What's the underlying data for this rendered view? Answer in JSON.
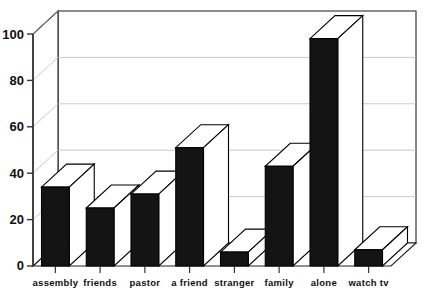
{
  "chart_data": {
    "type": "bar",
    "title": "",
    "subtitle": "",
    "xlabel": "",
    "ylabel": "",
    "categories": [
      "assembly",
      "friends",
      "pastor",
      "a friend",
      "stranger",
      "family",
      "alone",
      "watch tv"
    ],
    "values": [
      34,
      25,
      31,
      51,
      6,
      43,
      98,
      7
    ],
    "series": [
      {
        "name": "",
        "values": [
          34,
          25,
          31,
          51,
          6,
          43,
          98,
          7
        ]
      }
    ],
    "ylim": [
      0,
      100
    ],
    "yticks": [
      0,
      20,
      40,
      60,
      80,
      100
    ],
    "ytick_labels": [
      "0",
      "20",
      "40",
      "60",
      "80",
      "100"
    ],
    "grid": true,
    "grid_axis": "y",
    "legend": false,
    "legend_position": "none",
    "style": "3d-bar",
    "bar_color": "#141414",
    "bar_top_color": "#ffffff",
    "bar_side_color": "#ffffff",
    "bar_edge_color": "#000000",
    "grid_color": "#b8b8b8",
    "axis_color": "#333333",
    "background_color": "#ffffff"
  },
  "axis": {
    "y_tick_labels": [
      "100",
      "80",
      "60",
      "40",
      "20",
      "0"
    ]
  },
  "categories_labels": {
    "c0": "assembly",
    "c1": "friends",
    "c2": "pastor",
    "c3": "a friend",
    "c4": "stranger",
    "c5": "family",
    "c6": "alone",
    "c7": "watch tv"
  }
}
